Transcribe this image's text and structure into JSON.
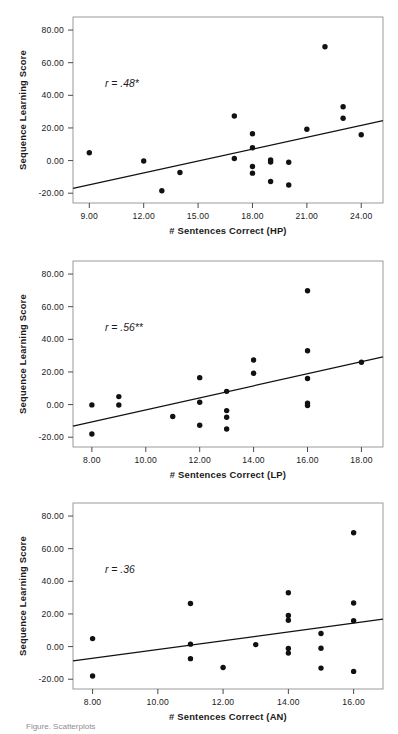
{
  "figure": {
    "background": "#ffffff",
    "point_color": "#111111",
    "line_color": "#111111",
    "frame_color": "#9a9a9a",
    "caption_fragment": "Figure. Scatterplots"
  },
  "chart_data": [
    {
      "type": "scatter",
      "id": "hp",
      "title": "",
      "xlabel": "# Sentences Correct (HP)",
      "ylabel": "Sequence Learning Score",
      "annotation": "r = .48*",
      "annotation_r": "r",
      "annotation_value": " = .48*",
      "xlim": [
        8.1,
        25.2
      ],
      "ylim": [
        -26,
        88
      ],
      "xticks": [
        9,
        12,
        15,
        18,
        21,
        24
      ],
      "xticklabels": [
        "9.00",
        "12.00",
        "15.00",
        "18.00",
        "21.00",
        "24.00"
      ],
      "yticks": [
        -20,
        0,
        20,
        40,
        60,
        80
      ],
      "yticklabels": [
        "-20.00",
        "0.00",
        "20.00",
        "40.00",
        "60.00",
        "80.00"
      ],
      "grid": false,
      "legend": "none",
      "trendline": {
        "x": [
          8.1,
          25.2
        ],
        "y": [
          -17.0,
          24.5
        ]
      },
      "points": [
        {
          "x": 9.0,
          "y": 4.8
        },
        {
          "x": 12.0,
          "y": -0.3
        },
        {
          "x": 13.0,
          "y": -18.5
        },
        {
          "x": 14.0,
          "y": -7.3
        },
        {
          "x": 17.0,
          "y": 27.3
        },
        {
          "x": 17.0,
          "y": 1.3
        },
        {
          "x": 18.0,
          "y": 16.4
        },
        {
          "x": 18.0,
          "y": 7.9
        },
        {
          "x": 18.0,
          "y": -3.6
        },
        {
          "x": 18.0,
          "y": -7.7
        },
        {
          "x": 19.0,
          "y": 0.4
        },
        {
          "x": 19.0,
          "y": -0.9
        },
        {
          "x": 19.0,
          "y": -12.8
        },
        {
          "x": 20.0,
          "y": -1.0
        },
        {
          "x": 20.0,
          "y": -15.0
        },
        {
          "x": 21.0,
          "y": 19.2
        },
        {
          "x": 22.0,
          "y": 69.8
        },
        {
          "x": 23.0,
          "y": 33.0
        },
        {
          "x": 23.0,
          "y": 25.9
        },
        {
          "x": 24.0,
          "y": 15.8
        }
      ]
    },
    {
      "type": "scatter",
      "id": "lp",
      "title": "",
      "xlabel": "# Sentences Correct (LP)",
      "ylabel": "Sequence Learning Score",
      "annotation": "r = .56**",
      "annotation_r": "r",
      "annotation_value": " = .56**",
      "xlim": [
        7.3,
        18.8
      ],
      "ylim": [
        -26,
        88
      ],
      "xticks": [
        8,
        10,
        12,
        14,
        16,
        18
      ],
      "xticklabels": [
        "8.00",
        "10.00",
        "12.00",
        "14.00",
        "16.00",
        "18.00"
      ],
      "yticks": [
        -20,
        0,
        20,
        40,
        60,
        80
      ],
      "yticklabels": [
        "-20.00",
        "0.00",
        "20.00",
        "40.00",
        "60.00",
        "80.00"
      ],
      "grid": false,
      "legend": "none",
      "trendline": {
        "x": [
          7.3,
          18.8
        ],
        "y": [
          -13.2,
          29.2
        ]
      },
      "points": [
        {
          "x": 8.0,
          "y": -0.2
        },
        {
          "x": 8.0,
          "y": -18.0
        },
        {
          "x": 9.0,
          "y": 4.9
        },
        {
          "x": 9.0,
          "y": -0.3
        },
        {
          "x": 11.0,
          "y": -7.3
        },
        {
          "x": 12.0,
          "y": 16.5
        },
        {
          "x": 12.0,
          "y": 1.4
        },
        {
          "x": 12.0,
          "y": -12.7
        },
        {
          "x": 13.0,
          "y": 8.1
        },
        {
          "x": 13.0,
          "y": -3.7
        },
        {
          "x": 13.0,
          "y": -7.8
        },
        {
          "x": 13.0,
          "y": -15.0
        },
        {
          "x": 14.0,
          "y": 27.3
        },
        {
          "x": 14.0,
          "y": 19.2
        },
        {
          "x": 16.0,
          "y": 69.8
        },
        {
          "x": 16.0,
          "y": 33.0
        },
        {
          "x": 16.0,
          "y": 16.0
        },
        {
          "x": 16.0,
          "y": 0.9
        },
        {
          "x": 16.0,
          "y": -0.6
        },
        {
          "x": 18.0,
          "y": 25.9
        }
      ]
    },
    {
      "type": "scatter",
      "id": "an",
      "title": "",
      "xlabel": "# Sentences Correct (AN)",
      "ylabel": "Sequence Learning Score",
      "annotation": "r = .36",
      "annotation_r": "r",
      "annotation_value": " = .36",
      "xlim": [
        7.4,
        16.9
      ],
      "ylim": [
        -26,
        88
      ],
      "xticks": [
        8,
        10,
        12,
        14,
        16
      ],
      "xticklabels": [
        "8.00",
        "10.00",
        "12.00",
        "14.00",
        "16.00"
      ],
      "yticks": [
        -20,
        0,
        20,
        40,
        60,
        80
      ],
      "yticklabels": [
        "-20.00",
        "0.00",
        "20.00",
        "40.00",
        "60.00",
        "80.00"
      ],
      "grid": false,
      "legend": "none",
      "trendline": {
        "x": [
          7.4,
          16.9
        ],
        "y": [
          -8.8,
          16.8
        ]
      },
      "points": [
        {
          "x": 8.0,
          "y": 4.9
        },
        {
          "x": 8.0,
          "y": -18.0
        },
        {
          "x": 11.0,
          "y": 26.4
        },
        {
          "x": 11.0,
          "y": 1.5
        },
        {
          "x": 11.0,
          "y": -7.4
        },
        {
          "x": 12.0,
          "y": -12.8
        },
        {
          "x": 13.0,
          "y": 1.2
        },
        {
          "x": 14.0,
          "y": 33.0
        },
        {
          "x": 14.0,
          "y": 19.1
        },
        {
          "x": 14.0,
          "y": 16.1
        },
        {
          "x": 14.0,
          "y": -1.2
        },
        {
          "x": 14.0,
          "y": -4.0
        },
        {
          "x": 15.0,
          "y": 8.0
        },
        {
          "x": 15.0,
          "y": -1.0
        },
        {
          "x": 15.0,
          "y": -13.2
        },
        {
          "x": 16.0,
          "y": 69.8
        },
        {
          "x": 16.0,
          "y": 26.7
        },
        {
          "x": 16.0,
          "y": 15.8
        },
        {
          "x": 16.0,
          "y": -15.2
        }
      ]
    }
  ]
}
